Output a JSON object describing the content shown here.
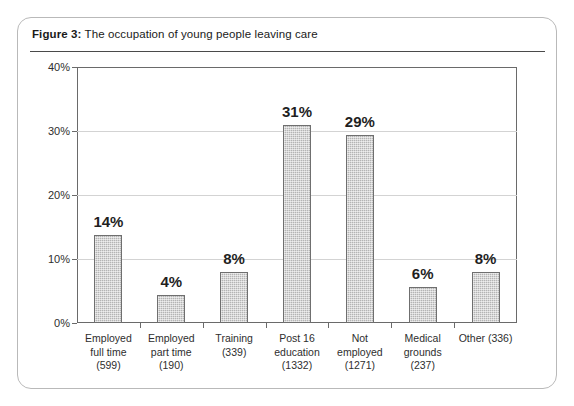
{
  "figure": {
    "label": "Figure 3:",
    "caption": "The occupation of young people leaving care"
  },
  "chart_data": {
    "type": "bar",
    "title": "The occupation of young people leaving care",
    "xlabel": "",
    "ylabel": "",
    "ylim": [
      0,
      40
    ],
    "ytick_labels": [
      "0%",
      "10%",
      "20%",
      "30%",
      "40%"
    ],
    "ytick_values": [
      0,
      10,
      20,
      30,
      40
    ],
    "grid": true,
    "legend": null,
    "categories": [
      "Employed full time (599)",
      "Employed part time (190)",
      "Training (339)",
      "Post 16 education (1332)",
      "Not employed (1271)",
      "Medical grounds (237)",
      "Other (336)"
    ],
    "category_lines": [
      [
        "Employed",
        "full time",
        "(599)"
      ],
      [
        "Employed",
        "part time",
        "(190)"
      ],
      [
        "Training",
        "(339)"
      ],
      [
        "Post 16",
        "education",
        "(1332)"
      ],
      [
        "Not",
        "employed",
        "(1271)"
      ],
      [
        "Medical",
        "grounds",
        "(237)"
      ],
      [
        "Other (336)"
      ]
    ],
    "counts": [
      599,
      190,
      339,
      1332,
      1271,
      237,
      336
    ],
    "values": [
      14,
      4,
      8,
      31,
      29,
      6,
      8
    ],
    "value_labels": [
      "14%",
      "4%",
      "8%",
      "31%",
      "29%",
      "6%",
      "8%"
    ],
    "bar_heights_pct": [
      13.8,
      4.4,
      8.0,
      31.0,
      29.4,
      5.6,
      8.0
    ]
  },
  "colors": {
    "bar_fill": "#b4b4b4",
    "bar_border": "#6f6f6f",
    "axis": "#6a6a6a",
    "gridline": "#d3d3d3",
    "card_border": "#b9b9b9",
    "rule": "#4a4a4a",
    "text": "#1f1f1f",
    "background": "#ffffff"
  }
}
